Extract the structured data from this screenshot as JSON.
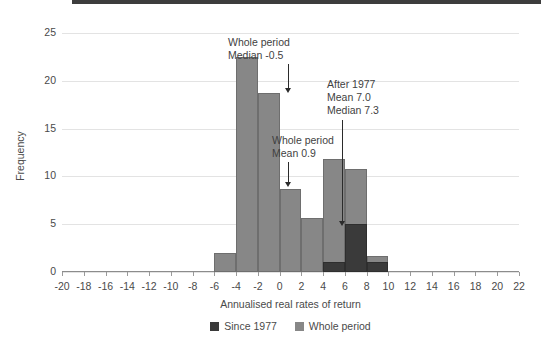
{
  "chart_data": {
    "type": "bar",
    "title": "",
    "subtitle": "",
    "xlabel": "Annualised real rates of return",
    "ylabel": "Frequency",
    "xlim": [
      -20,
      22
    ],
    "ylim": [
      0,
      25
    ],
    "grid": true,
    "legend_position": "bottom",
    "bin_width": 2,
    "x_ticks": [
      -20,
      -18,
      -16,
      -14,
      -12,
      -10,
      -8,
      -6,
      -4,
      -2,
      0,
      2,
      4,
      6,
      8,
      10,
      12,
      14,
      16,
      18,
      20,
      22
    ],
    "y_ticks": [
      0,
      5,
      10,
      15,
      20,
      25
    ],
    "bin_starts": [
      -6,
      -4,
      -2,
      0,
      2,
      4,
      6,
      8
    ],
    "bin_labels": [
      "-6 to -4",
      "-4 to -2",
      "-2 to 0",
      "0 to 2",
      "2 to 4",
      "4 to 6",
      "6 to 8",
      "8 to 10"
    ],
    "series": [
      {
        "name": "Whole period",
        "color": "#878787",
        "values": [
          2,
          22.5,
          18.7,
          8.7,
          5.7,
          11.8,
          10.8,
          1.7
        ]
      },
      {
        "name": "Since 1977",
        "color": "#3a3a3a",
        "values": [
          0,
          0,
          0,
          0,
          0,
          1,
          5,
          1
        ]
      }
    ],
    "annotations": [
      {
        "id": "whole-period-median",
        "lines": [
          "Whole period",
          "Median -0.5"
        ],
        "target_x": -0.5,
        "target_y": 18.7
      },
      {
        "id": "whole-period-mean",
        "lines": [
          "Whole period",
          "Mean 0.9"
        ],
        "target_x": 0.9,
        "target_y": 8.7
      },
      {
        "id": "after-1977",
        "lines": [
          "After 1977",
          "Mean 7.0",
          "Median 7.3"
        ],
        "target_x": 7.0,
        "target_y": 5.0
      }
    ]
  },
  "axes": {
    "y_label": "Frequency",
    "x_label": "Annualised real rates of return",
    "y_tick_labels": [
      "25",
      "20",
      "15",
      "10",
      "5",
      "0"
    ],
    "x_tick_labels": [
      "-20",
      "-18",
      "-16",
      "-14",
      "-12",
      "-10",
      "-8",
      "-6",
      "-4",
      "-2",
      "0",
      "2",
      "4",
      "6",
      "8",
      "10",
      "12",
      "14",
      "16",
      "18",
      "20",
      "22"
    ]
  },
  "legend": {
    "items": [
      {
        "label": "Since 1977",
        "color": "#3a3a3a"
      },
      {
        "label": "Whole period",
        "color": "#878787"
      }
    ]
  },
  "annotation_text": {
    "a1_line1": "Whole period",
    "a1_line2": "Median -0.5",
    "a2_line1": "Whole period",
    "a2_line2": "Mean 0.9",
    "a3_line1": "After 1977",
    "a3_line2": "Mean 7.0",
    "a3_line3": "Median 7.3"
  },
  "colors": {
    "whole_period": "#878787",
    "since_1977": "#3a3a3a",
    "grid": "#e3e3e3",
    "axis": "#8c8c8c",
    "text": "#4a4a4a",
    "topbar": "#3d3d3d"
  }
}
